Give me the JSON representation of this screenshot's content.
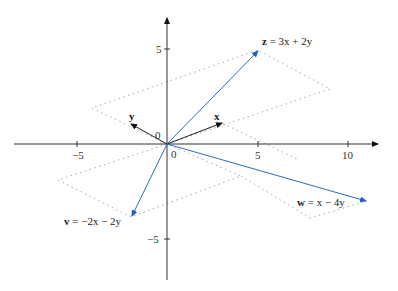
{
  "diagram": {
    "type": "vector-diagram",
    "axes": {
      "x_ticks": [
        {
          "value": -5,
          "label": "−5"
        },
        {
          "value": 5,
          "label": "5"
        },
        {
          "value": 10,
          "label": "10"
        }
      ],
      "y_ticks": [
        {
          "value": 5,
          "label": "5"
        },
        {
          "value": -5,
          "label": "−5"
        }
      ],
      "origin_labels": [
        "0",
        "0"
      ]
    },
    "basis_vectors": {
      "x": {
        "label": "x"
      },
      "y": {
        "label": "y"
      }
    },
    "combination_vectors": [
      {
        "name": "z",
        "label_name": "z",
        "label_rest": " = 3x + 2y",
        "expression": "z = 3x + 2y",
        "coeffs": [
          3,
          2
        ]
      },
      {
        "name": "v",
        "label_name": "v",
        "label_rest": " = −2x − 2y",
        "expression": "v = −2x − 2y",
        "coeffs": [
          -2,
          -2
        ]
      },
      {
        "name": "w",
        "label_name": "w",
        "label_rest": " = x − 4y",
        "expression": "w = x − 4y",
        "coeffs": [
          1,
          -4
        ]
      }
    ],
    "colors": {
      "axis": "#333333",
      "basis_vector": "#222222",
      "combination_vector": "#2b6cc4",
      "parallelogram": "#aaaaaa"
    }
  }
}
